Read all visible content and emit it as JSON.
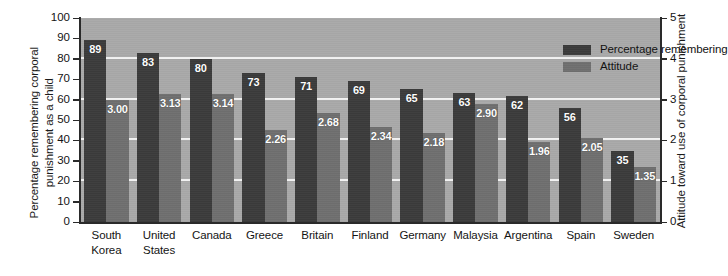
{
  "chart_data": {
    "type": "bar",
    "title": "",
    "subtitle": "",
    "categories": [
      "South Korea",
      "United States",
      "Canada",
      "Greece",
      "Britain",
      "Finland",
      "Germany",
      "Malaysia",
      "Argentina",
      "Spain",
      "Sweden"
    ],
    "category_label_lines": [
      [
        "South",
        "Korea"
      ],
      [
        "United",
        "States"
      ],
      [
        "Canada"
      ],
      [
        "Greece"
      ],
      [
        "Britain"
      ],
      [
        "Finland"
      ],
      [
        "Germany"
      ],
      [
        "Malaysia"
      ],
      [
        "Argentina"
      ],
      [
        "Spain"
      ],
      [
        "Sweden"
      ]
    ],
    "series": [
      {
        "name": "Percentage remembering",
        "axis": "left",
        "color": "#3b3b3b",
        "values": [
          89,
          83,
          80,
          73,
          71,
          69,
          65,
          63,
          62,
          56,
          35
        ],
        "value_labels": [
          "89",
          "83",
          "80",
          "73",
          "71",
          "69",
          "65",
          "63",
          "62",
          "56",
          "35"
        ]
      },
      {
        "name": "Attitude",
        "axis": "right",
        "color": "#6f6f6f",
        "values": [
          3.0,
          3.13,
          3.14,
          2.26,
          2.68,
          2.34,
          2.18,
          2.9,
          1.96,
          2.05,
          1.35
        ],
        "value_labels": [
          "3.00",
          "3.13",
          "3.14",
          "2.26",
          "2.68",
          "2.34",
          "2.18",
          "2.90",
          "1.96",
          "2.05",
          "1.35"
        ]
      }
    ],
    "xlabel": "",
    "ylabel": "Percentage remembering corporal punishment as a child",
    "ylabel_lines": [
      "Percentage remembering corporal",
      "punishment as a child"
    ],
    "y2label": "Attitude toward use of corporal punishment",
    "ylim": [
      0,
      100
    ],
    "y2lim": [
      0,
      5
    ],
    "yticks": [
      0,
      10,
      20,
      30,
      40,
      50,
      60,
      70,
      80,
      90,
      100
    ],
    "ytick_labels": [
      "0",
      "10",
      "20",
      "30",
      "40",
      "50",
      "60",
      "70",
      "80",
      "90",
      "100"
    ],
    "y2ticks": [
      0,
      1,
      2,
      3,
      4,
      5
    ],
    "y2tick_labels": [
      "0",
      "1",
      "2",
      "3",
      "4",
      "5"
    ],
    "gridlines_y": [
      20,
      40,
      60,
      80
    ],
    "grid": true,
    "grid_color": "#f2f2f2",
    "legend_position": "top-right",
    "plot_background": "#a9a9a9"
  },
  "legend": {
    "items": [
      {
        "label": "Percentage remembering",
        "color": "#3b3b3b"
      },
      {
        "label": "Attitude",
        "color": "#6f6f6f"
      }
    ]
  }
}
